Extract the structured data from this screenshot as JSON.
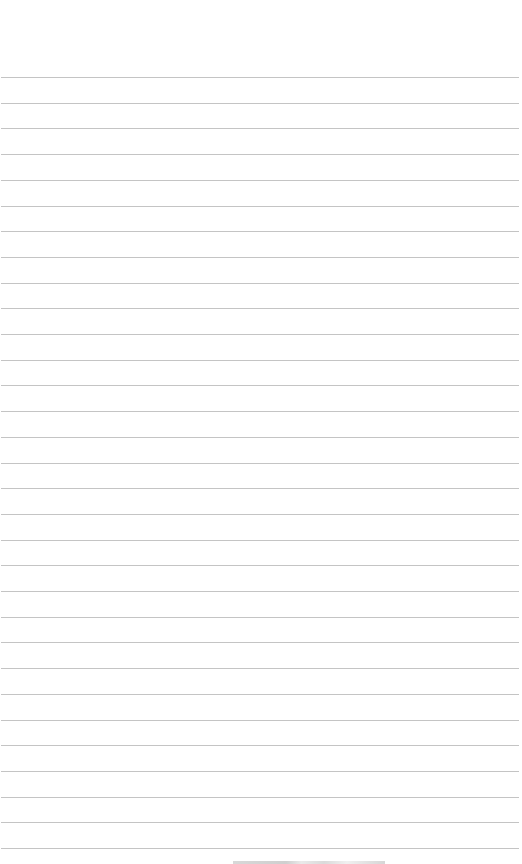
{
  "page": {
    "type": "lined-paper",
    "background_color": "#ffffff",
    "rule_color": "#c4c4c4",
    "rule_count": 31,
    "first_rule_y": 77,
    "rule_spacing": 25.7,
    "text": ""
  }
}
